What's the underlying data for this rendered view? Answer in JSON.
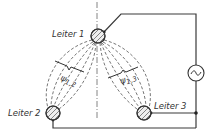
{
  "diagram": {
    "type": "magnetic-flux-linkage-three-conductors",
    "conductors": [
      {
        "id": "leiter1",
        "label": "Leiter 1",
        "cx": 98,
        "cy": 36,
        "r": 7
      },
      {
        "id": "leiter2",
        "label": "Leiter 2",
        "cx": 53,
        "cy": 113,
        "r": 7
      },
      {
        "id": "leiter3",
        "label": "Leiter 3",
        "cx": 144,
        "cy": 113,
        "r": 7
      }
    ],
    "flux_labels": [
      {
        "id": "psi12",
        "symbol": "ψ",
        "subscript": "1,2"
      },
      {
        "id": "psi13",
        "symbol": "ψ",
        "subscript": "1,3"
      }
    ],
    "source": {
      "symbol": "~",
      "type": "ac-voltage-source"
    },
    "colors": {
      "line": "#3a3a3a",
      "background": "#ffffff",
      "hatch": "#555555"
    }
  }
}
